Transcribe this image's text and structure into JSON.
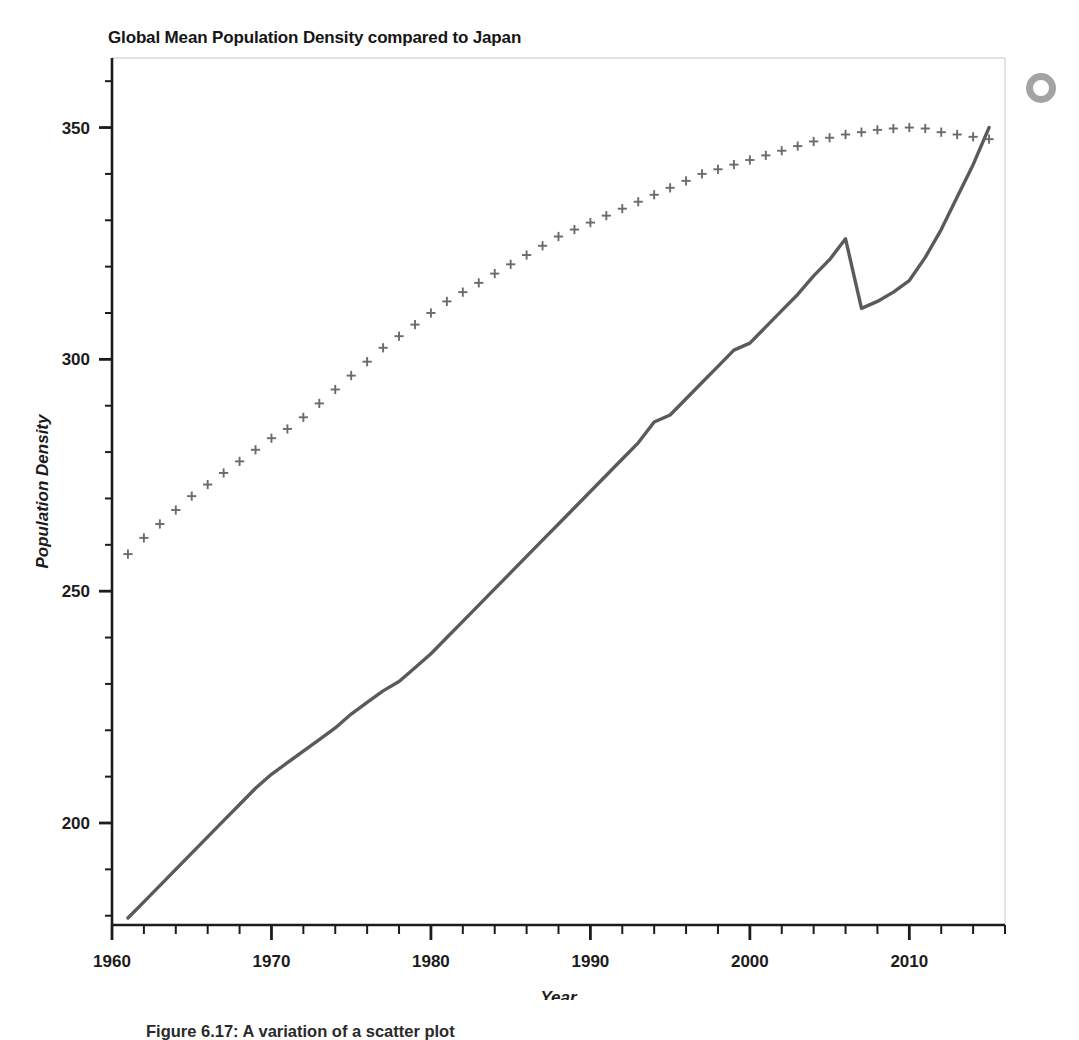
{
  "figure": {
    "title": "Global Mean Population Density compared to Japan",
    "caption": "Figure 6.17: A variation of a scatter plot",
    "artifact_name": "ring-scan-artifact"
  },
  "chart_data": {
    "type": "line",
    "title": "Global Mean Population Density compared to Japan",
    "xlabel": "Year",
    "ylabel": "Population Density",
    "xlim": [
      1960,
      2016
    ],
    "ylim": [
      178,
      365
    ],
    "grid": false,
    "legend": "none",
    "x_ticks_major": [
      1960,
      1970,
      1980,
      1990,
      2000,
      2010
    ],
    "x_ticks_major_labels": [
      "1960",
      "1970",
      "1980",
      "1990",
      "2000",
      "2010"
    ],
    "x_tick_minor_step": 2,
    "y_ticks_major": [
      200,
      250,
      300,
      350
    ],
    "y_ticks_major_labels": [
      "200",
      "250",
      "300",
      "350"
    ],
    "y_tick_minor_step": 10,
    "colors": {
      "line_series": "#5a5a5a",
      "marker_series": "#6b6b6b",
      "axis": "#1c1c1c",
      "frame": "#d8d8d8",
      "background": "#ffffff"
    },
    "series": [
      {
        "name": "Japan",
        "style": "solid-line",
        "marker": "none",
        "color": "#5a5a5a",
        "x": [
          1961,
          1962,
          1963,
          1964,
          1965,
          1966,
          1967,
          1968,
          1969,
          1970,
          1971,
          1972,
          1973,
          1974,
          1975,
          1976,
          1977,
          1978,
          1979,
          1980,
          1981,
          1982,
          1983,
          1984,
          1985,
          1986,
          1987,
          1988,
          1989,
          1990,
          1991,
          1992,
          1993,
          1994,
          1995,
          1996,
          1997,
          1998,
          1999,
          2000,
          2001,
          2002,
          2003,
          2004,
          2005,
          2006,
          2007,
          2008,
          2009,
          2010,
          2011,
          2012,
          2013,
          2014,
          2015
        ],
        "values": [
          179.5,
          183.0,
          186.5,
          190.0,
          193.5,
          197.0,
          200.5,
          204.0,
          207.5,
          210.5,
          213.0,
          215.5,
          218.0,
          220.5,
          223.5,
          226.0,
          228.5,
          230.5,
          233.5,
          236.5,
          240.0,
          243.5,
          247.0,
          250.5,
          254.0,
          257.5,
          261.0,
          264.5,
          268.0,
          271.5,
          275.0,
          278.5,
          282.0,
          286.5,
          288.0,
          291.5,
          295.0,
          298.5,
          302.0,
          303.5,
          307.0,
          310.5,
          314.0,
          318.0,
          321.5,
          326.0,
          311.0,
          312.5,
          314.5,
          317.0,
          322.0,
          328.0,
          335.0,
          342.0,
          350.0
        ]
      },
      {
        "name": "Global Mean",
        "style": "markers",
        "marker": "plus",
        "color": "#6b6b6b",
        "x": [
          1961,
          1962,
          1963,
          1964,
          1965,
          1966,
          1967,
          1968,
          1969,
          1970,
          1971,
          1972,
          1973,
          1974,
          1975,
          1976,
          1977,
          1978,
          1979,
          1980,
          1981,
          1982,
          1983,
          1984,
          1985,
          1986,
          1987,
          1988,
          1989,
          1990,
          1991,
          1992,
          1993,
          1994,
          1995,
          1996,
          1997,
          1998,
          1999,
          2000,
          2001,
          2002,
          2003,
          2004,
          2005,
          2006,
          2007,
          2008,
          2009,
          2010,
          2011,
          2012,
          2013,
          2014,
          2015
        ],
        "values": [
          258.0,
          261.5,
          264.5,
          267.5,
          270.5,
          273.0,
          275.5,
          278.0,
          280.5,
          283.0,
          285.0,
          287.5,
          290.5,
          293.5,
          296.5,
          299.5,
          302.5,
          305.0,
          307.5,
          310.0,
          312.5,
          314.5,
          316.5,
          318.5,
          320.5,
          322.5,
          324.5,
          326.5,
          328.0,
          329.5,
          331.0,
          332.5,
          334.0,
          335.5,
          337.0,
          338.5,
          340.0,
          341.0,
          342.0,
          343.0,
          344.0,
          345.0,
          346.0,
          347.0,
          347.8,
          348.5,
          349.0,
          349.5,
          349.8,
          350.0,
          349.8,
          349.0,
          348.5,
          348.0,
          347.5
        ]
      }
    ]
  }
}
